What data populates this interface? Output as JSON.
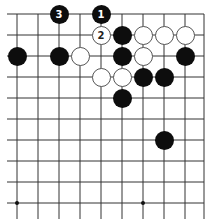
{
  "board": {
    "grid": {
      "xs": [
        17,
        38,
        59,
        80,
        101,
        122,
        143,
        164,
        185,
        204
      ],
      "ys": [
        14,
        35,
        56,
        77,
        98,
        119,
        140,
        161,
        182,
        203
      ],
      "line_color": "#333333"
    },
    "star_points": [
      [
        0,
        9
      ],
      [
        6,
        9
      ]
    ],
    "stones": [
      {
        "col": 2,
        "row": 0,
        "color": "black",
        "label": "3"
      },
      {
        "col": 4,
        "row": 0,
        "color": "black",
        "label": "1"
      },
      {
        "col": 4,
        "row": 1,
        "color": "white",
        "label": "2"
      },
      {
        "col": 5,
        "row": 1,
        "color": "black",
        "label": ""
      },
      {
        "col": 6,
        "row": 1,
        "color": "white",
        "label": ""
      },
      {
        "col": 7,
        "row": 1,
        "color": "white",
        "label": ""
      },
      {
        "col": 8,
        "row": 1,
        "color": "white",
        "label": ""
      },
      {
        "col": 0,
        "row": 2,
        "color": "black",
        "label": ""
      },
      {
        "col": 2,
        "row": 2,
        "color": "black",
        "label": ""
      },
      {
        "col": 3,
        "row": 2,
        "color": "white",
        "label": ""
      },
      {
        "col": 5,
        "row": 2,
        "color": "black",
        "label": ""
      },
      {
        "col": 6,
        "row": 2,
        "color": "white",
        "label": ""
      },
      {
        "col": 8,
        "row": 2,
        "color": "black",
        "label": ""
      },
      {
        "col": 4,
        "row": 3,
        "color": "white",
        "label": ""
      },
      {
        "col": 5,
        "row": 3,
        "color": "white",
        "label": ""
      },
      {
        "col": 6,
        "row": 3,
        "color": "black",
        "label": ""
      },
      {
        "col": 7,
        "row": 3,
        "color": "black",
        "label": ""
      },
      {
        "col": 5,
        "row": 4,
        "color": "black",
        "label": ""
      },
      {
        "col": 7,
        "row": 6,
        "color": "black",
        "label": ""
      }
    ]
  }
}
